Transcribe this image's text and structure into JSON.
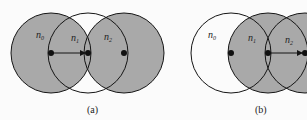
{
  "figures": [
    {
      "caption": "(a)",
      "nodes": [
        {
          "id": "n0",
          "label": "n",
          "sub": "0",
          "cx": 51,
          "cy": 53,
          "r": 40,
          "filled": true
        },
        {
          "id": "n1",
          "label": "n",
          "sub": "1",
          "cx": 88,
          "cy": 53,
          "r": 40,
          "filled": false
        },
        {
          "id": "n2",
          "label": "n",
          "sub": "2",
          "cx": 124,
          "cy": 53,
          "r": 40,
          "filled": true
        }
      ],
      "arrow": {
        "from": "n0",
        "to": "n1"
      }
    },
    {
      "caption": "(b)",
      "nodes": [
        {
          "id": "n0",
          "label": "n",
          "sub": "0",
          "cx": 231,
          "cy": 53,
          "r": 40,
          "filled": false
        },
        {
          "id": "n1",
          "label": "n",
          "sub": "1",
          "cx": 268,
          "cy": 53,
          "r": 40,
          "filled": true
        },
        {
          "id": "n2",
          "label": "n",
          "sub": "2",
          "cx": 305,
          "cy": 53,
          "r": 40,
          "filled": true
        }
      ],
      "arrow": {
        "from": "n1",
        "to": "n2"
      }
    }
  ],
  "colors": {
    "fill": "#a9a9a9",
    "stroke": "#151515",
    "background": "#fbfbfb"
  }
}
